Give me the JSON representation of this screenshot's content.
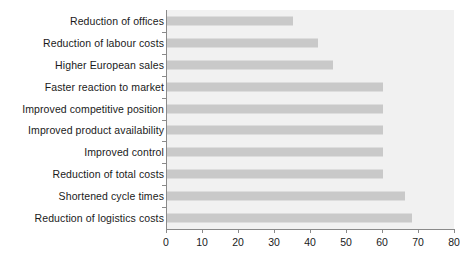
{
  "chart_data": {
    "type": "bar",
    "orientation": "horizontal",
    "title": "",
    "subtitle": "",
    "xlabel": "",
    "ylabel": "",
    "xlim": [
      0,
      80
    ],
    "xticks": [
      "0",
      "10",
      "20",
      "30",
      "40",
      "50",
      "60",
      "70",
      "80"
    ],
    "xtick_values": [
      0,
      10,
      20,
      30,
      40,
      50,
      60,
      70,
      80
    ],
    "grid": false,
    "legend": null,
    "bar_color": "#c9c9c9",
    "plot_background": "#f1f1f1",
    "axis_color": "#8a8a8a",
    "categories": [
      "Reduction of offices",
      "Reduction of labour costs",
      "Higher European sales",
      "Faster reaction to market",
      "Improved competitive position",
      "Improved product availability",
      "Improved control",
      "Reduction of total costs",
      "Shortened cycle times",
      "Reduction of logistics costs"
    ],
    "values": [
      35,
      42,
      46,
      60,
      60,
      60,
      60,
      60,
      66,
      68
    ]
  }
}
